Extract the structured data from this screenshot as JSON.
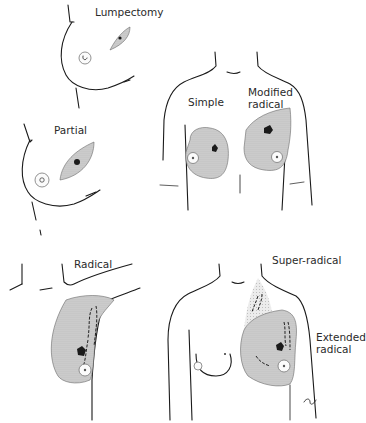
{
  "diagram": {
    "type": "medical-illustration",
    "panels": [
      {
        "id": "lumpectomy",
        "label": "Lumpectomy"
      },
      {
        "id": "partial",
        "label": "Partial"
      },
      {
        "id": "simple",
        "label": "Simple"
      },
      {
        "id": "modified-radical",
        "label_line1": "Modified",
        "label_line2": "radical"
      },
      {
        "id": "radical",
        "label": "Radical"
      },
      {
        "id": "super-radical",
        "label": "Super-radical"
      },
      {
        "id": "extended-radical",
        "label_line1": "Extended",
        "label_line2": "radical"
      }
    ],
    "colors": {
      "line": "#1a1a1a",
      "shading": "#c8c8c8",
      "text": "#2a2a2a",
      "background": "#ffffff"
    },
    "signature": "⌐ℓ"
  }
}
